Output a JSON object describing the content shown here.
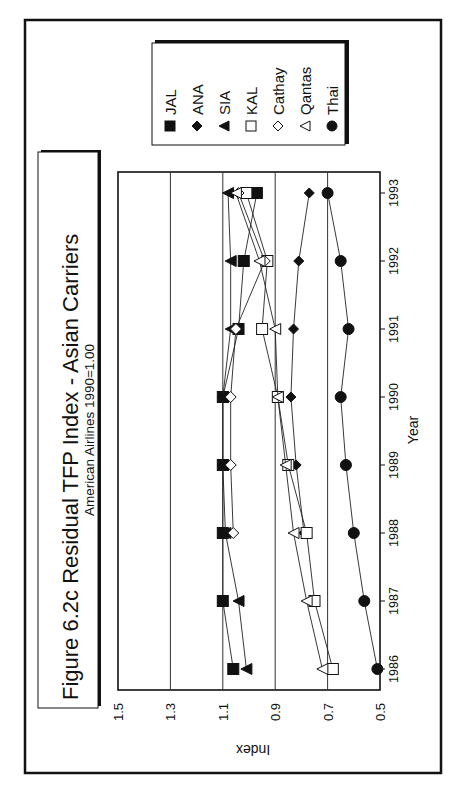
{
  "figure": {
    "title": "Figure 6.2c  Residual TFP Index - Asian Carriers",
    "subtitle": "American Airlines 1990=1.00",
    "orientation": "rotated-90-ccw"
  },
  "chart_data": {
    "type": "line",
    "title": "Figure 6.2c  Residual TFP Index - Asian Carriers",
    "subtitle": "American Airlines 1990=1.00",
    "xlabel": "Year",
    "ylabel": "Index",
    "x": [
      1986,
      1987,
      1988,
      1989,
      1990,
      1991,
      1992,
      1993
    ],
    "x_tick_labels": [
      "1986",
      "1987",
      "1988",
      "1989",
      "1990",
      "1991",
      "1992",
      "1993"
    ],
    "ylim": [
      0.5,
      1.5
    ],
    "y_ticks": [
      1.5,
      1.3,
      1.1,
      0.9,
      0.7,
      0.5
    ],
    "y_tick_labels": [
      "1.5",
      "1.3",
      "1.1",
      "0.9",
      "0.7",
      "0.5"
    ],
    "grid": "horizontal at 0.7, 0.9, 1.1, 1.3",
    "legend_position": "top-right (rotated)",
    "series": [
      {
        "name": "JAL",
        "marker": "filled-square",
        "values": [
          1.06,
          1.1,
          1.1,
          1.1,
          1.1,
          1.04,
          1.02,
          0.97
        ]
      },
      {
        "name": "ANA",
        "marker": "filled-diamond",
        "values": [
          null,
          null,
          0.79,
          0.82,
          0.84,
          0.83,
          0.81,
          0.77
        ]
      },
      {
        "name": "SIA",
        "marker": "filled-triangle",
        "values": [
          1.01,
          1.04,
          1.09,
          1.1,
          1.1,
          1.07,
          1.07,
          1.08
        ]
      },
      {
        "name": "KAL",
        "marker": "open-square",
        "values": [
          0.68,
          0.75,
          0.78,
          0.85,
          0.89,
          0.95,
          0.93,
          1.01
        ]
      },
      {
        "name": "Cathay",
        "marker": "open-diamond",
        "values": [
          null,
          null,
          1.06,
          1.07,
          1.07,
          1.05,
          0.94,
          1.04
        ]
      },
      {
        "name": "Qantas",
        "marker": "open-triangle",
        "values": [
          0.72,
          0.78,
          0.83,
          0.86,
          0.89,
          0.9,
          0.96,
          1.05
        ]
      },
      {
        "name": "Thai",
        "marker": "filled-circle",
        "values": [
          0.51,
          0.56,
          0.6,
          0.63,
          0.65,
          0.62,
          0.65,
          0.7
        ]
      }
    ]
  },
  "legend": {
    "items": [
      {
        "label": "JAL",
        "marker": "filled-square"
      },
      {
        "label": "ANA",
        "marker": "filled-diamond"
      },
      {
        "label": "SIA",
        "marker": "filled-triangle"
      },
      {
        "label": "KAL",
        "marker": "open-square"
      },
      {
        "label": "Cathay",
        "marker": "open-diamond"
      },
      {
        "label": "Qantas",
        "marker": "open-triangle"
      },
      {
        "label": "Thai",
        "marker": "filled-circle"
      }
    ]
  },
  "colors": {
    "ink": "#111111",
    "grid": "#333333",
    "background": "#ffffff"
  }
}
